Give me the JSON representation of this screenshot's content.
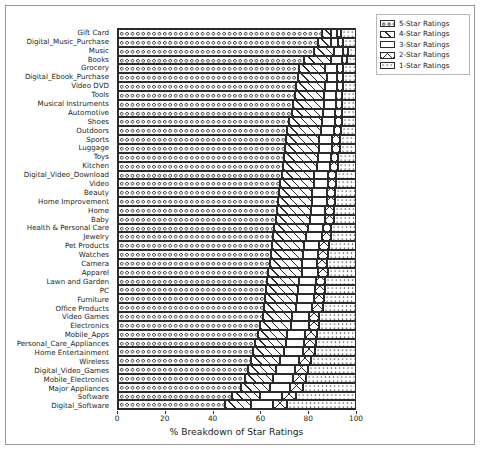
{
  "chart_data": {
    "type": "bar",
    "orientation": "horizontal",
    "stacked": true,
    "title": "",
    "xlabel": "% Breakdown of Star Ratings",
    "ylabel": "",
    "xlim": [
      0,
      100
    ],
    "xticks": [
      0,
      20,
      40,
      60,
      80,
      100
    ],
    "grid": false,
    "legend_position": "upper right",
    "categories": [
      "Gift Card",
      "Digital_Music_Purchase",
      "Music",
      "Books",
      "Grocery",
      "Digital_Ebook_Purchase",
      "Video DVD",
      "Tools",
      "Musical Instruments",
      "Automotive",
      "Shoes",
      "Outdoors",
      "Sports",
      "Luggage",
      "Toys",
      "Kitchen",
      "Digital_Video_Download",
      "Video",
      "Beauty",
      "Home Improvement",
      "Home",
      "Baby",
      "Health & Personal Care",
      "Jewelry",
      "Pet Products",
      "Watches",
      "Camera",
      "Apparel",
      "Lawn and Garden",
      "PC",
      "Furniture",
      "Office Products",
      "Video Games",
      "Electronics",
      "Mobile_Apps",
      "Personal_Care_Appliances",
      "Home Entertainment",
      "Wireless",
      "Digital_Video_Games",
      "Mobile_Electronics",
      "Major Appliances",
      "Software",
      "Digital_Software"
    ],
    "series": [
      {
        "name": "5-Star Ratings",
        "hatch": "o",
        "values": [
          86.0,
          84.5,
          82.5,
          78.5,
          76.5,
          76.0,
          75.0,
          74.5,
          74.0,
          73.5,
          72.0,
          71.5,
          71.0,
          70.5,
          70.0,
          69.5,
          69.0,
          68.5,
          68.0,
          67.5,
          67.0,
          66.5,
          66.0,
          65.5,
          65.0,
          64.5,
          64.0,
          63.5,
          63.0,
          62.5,
          62.0,
          61.5,
          61.0,
          60.0,
          59.0,
          58.0,
          57.0,
          56.0,
          55.0,
          53.5,
          52.0,
          48.0,
          45.0
        ]
      },
      {
        "name": "4-Star Ratings",
        "hatch": "/",
        "values": [
          4.0,
          5.5,
          8.5,
          11.5,
          11.0,
          12.0,
          12.5,
          12.5,
          13.0,
          13.0,
          14.0,
          14.0,
          14.0,
          14.5,
          14.5,
          14.5,
          13.5,
          14.0,
          14.0,
          14.5,
          14.5,
          14.5,
          14.0,
          14.0,
          13.5,
          13.5,
          13.5,
          14.0,
          13.5,
          13.5,
          13.5,
          13.5,
          12.5,
          13.0,
          12.5,
          13.0,
          13.0,
          12.5,
          11.5,
          12.0,
          12.0,
          12.0,
          11.0
        ]
      },
      {
        "name": "3-Star Ratings",
        "hatch": "",
        "values": [
          2.5,
          3.0,
          4.0,
          4.5,
          5.0,
          4.5,
          5.0,
          5.0,
          5.0,
          5.0,
          5.5,
          5.5,
          5.5,
          5.5,
          5.5,
          5.5,
          6.0,
          6.0,
          6.0,
          6.0,
          6.0,
          6.5,
          6.5,
          6.5,
          6.5,
          6.5,
          6.5,
          7.0,
          7.0,
          7.0,
          7.0,
          7.0,
          7.0,
          7.5,
          7.5,
          7.5,
          8.0,
          8.0,
          8.0,
          8.5,
          8.5,
          9.0,
          9.5
        ]
      },
      {
        "name": "2-Star Ratings",
        "hatch": "x",
        "values": [
          1.5,
          2.0,
          2.0,
          2.0,
          2.5,
          2.5,
          2.5,
          2.5,
          2.5,
          3.0,
          3.0,
          3.0,
          3.0,
          3.0,
          3.0,
          3.5,
          3.5,
          3.5,
          3.5,
          3.5,
          3.5,
          3.5,
          3.5,
          4.0,
          4.0,
          4.0,
          4.0,
          4.0,
          4.0,
          4.5,
          4.5,
          4.5,
          4.5,
          4.5,
          5.0,
          5.0,
          5.0,
          5.0,
          5.5,
          5.5,
          5.5,
          6.0,
          6.0
        ]
      },
      {
        "name": "1-Star Ratings",
        "hatch": ".",
        "values": [
          6.0,
          5.0,
          3.0,
          3.5,
          5.0,
          5.0,
          5.0,
          5.5,
          5.5,
          5.5,
          5.5,
          6.0,
          6.5,
          6.5,
          7.0,
          7.0,
          8.0,
          8.0,
          8.5,
          8.5,
          9.0,
          9.0,
          10.0,
          10.0,
          11.0,
          11.5,
          12.0,
          11.5,
          12.5,
          12.5,
          13.0,
          13.5,
          15.0,
          15.0,
          16.0,
          16.5,
          17.0,
          18.5,
          20.0,
          20.5,
          22.0,
          25.0,
          28.5
        ]
      }
    ]
  },
  "legend": {
    "items": [
      {
        "label": "5-Star Ratings",
        "hatch_class": "h5"
      },
      {
        "label": "4-Star Ratings",
        "hatch_class": "h4"
      },
      {
        "label": "3-Star Ratings",
        "hatch_class": "h3"
      },
      {
        "label": "2-Star Ratings",
        "hatch_class": "h2"
      },
      {
        "label": "1-Star Ratings",
        "hatch_class": "h1"
      }
    ]
  },
  "colors": {
    "foreground": "#2b2b2b",
    "background": "#ffffff",
    "border": "#9a9a9a"
  }
}
